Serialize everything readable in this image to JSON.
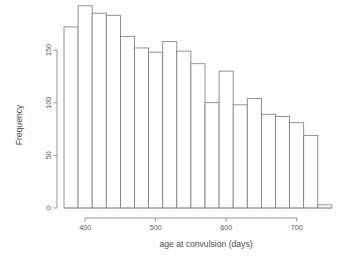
{
  "chart_data": {
    "type": "bar",
    "title": "",
    "subtitle": "",
    "xlabel": "age at convulsion (days)",
    "ylabel": "Frequency",
    "xlim": [
      368,
      752
    ],
    "ylim": [
      0,
      196
    ],
    "grid": false,
    "legend": null,
    "bin_width": 20,
    "bin_starts": [
      370,
      390,
      410,
      430,
      450,
      470,
      490,
      510,
      530,
      550,
      570,
      590,
      610,
      630,
      650,
      670,
      690,
      710,
      730
    ],
    "bin_ends": [
      390,
      410,
      430,
      450,
      470,
      490,
      510,
      530,
      550,
      570,
      590,
      610,
      630,
      650,
      670,
      690,
      710,
      730,
      750
    ],
    "categories": [
      "370-390",
      "390-410",
      "410-430",
      "430-450",
      "450-470",
      "470-490",
      "490-510",
      "510-530",
      "530-550",
      "550-570",
      "570-590",
      "590-610",
      "610-630",
      "630-650",
      "650-670",
      "670-690",
      "690-710",
      "710-730",
      "730-750"
    ],
    "values": [
      172,
      192,
      185,
      183,
      163,
      152,
      148,
      158,
      149,
      137,
      100,
      130,
      98,
      104,
      89,
      87,
      81,
      69,
      3
    ],
    "xticks": [
      400,
      500,
      600,
      700
    ],
    "xtick_labels": [
      "400",
      "500",
      "600",
      "700"
    ],
    "yticks": [
      0,
      50,
      100,
      150
    ],
    "ytick_labels": [
      "0",
      "50",
      "100",
      "150"
    ],
    "axis_color": "#8a8a8a",
    "bar_stroke": "#777777",
    "bar_fill": "#ffffff",
    "background": "#ffffff"
  }
}
